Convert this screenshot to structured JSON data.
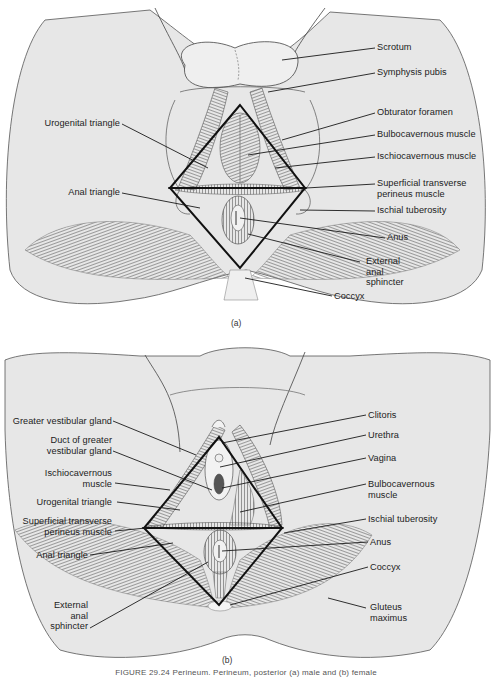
{
  "figure": {
    "caption": "FIGURE 29.24 Perineum. Perineum, posterior (a) male and (b) female",
    "panels": [
      {
        "id": "a",
        "tag": "(a)",
        "subject": "male perineum",
        "labels_left": [
          {
            "text": "Urogenital triangle"
          },
          {
            "text": "Anal triangle"
          }
        ],
        "labels_right": [
          {
            "text": "Scrotum"
          },
          {
            "text": "Symphysis pubis"
          },
          {
            "text": "Obturator foramen"
          },
          {
            "text": "Bulbocavernous muscle"
          },
          {
            "text": "Ischiocavernous muscle"
          },
          {
            "text": "Superficial transverse\nperineus muscle",
            "line1": "Superficial transverse",
            "line2": "perineus muscle"
          },
          {
            "text": "Ischial tuberosity"
          },
          {
            "text": "Anus"
          },
          {
            "text": "External anal sphincter",
            "line1": "External",
            "line2": "anal",
            "line3": "sphincter"
          },
          {
            "text": "Coccyx"
          }
        ]
      },
      {
        "id": "b",
        "tag": "(b)",
        "subject": "female perineum",
        "labels_left": [
          {
            "text": "Greater vestibular gland"
          },
          {
            "text": "Duct of greater vestibular gland",
            "line1": "Duct of greater",
            "line2": "vestibular gland"
          },
          {
            "text": "Ischiocavernous muscle",
            "line1": "Ischiocavernous",
            "line2": "muscle"
          },
          {
            "text": "Urogenital triangle"
          },
          {
            "text": "Superficial transverse perineus muscle",
            "line1": "Superficial transverse",
            "line2": "perineus muscle"
          },
          {
            "text": "Anal triangle"
          },
          {
            "text": "External anal sphincter",
            "line1": "External",
            "line2": "anal",
            "line3": "sphincter"
          }
        ],
        "labels_right": [
          {
            "text": "Clitoris"
          },
          {
            "text": "Urethra"
          },
          {
            "text": "Vagina"
          },
          {
            "text": "Bulbocavernous muscle",
            "line1": "Bulbocavernous",
            "line2": "muscle"
          },
          {
            "text": "Ischial tuberosity"
          },
          {
            "text": "Anus"
          },
          {
            "text": "Coccyx"
          },
          {
            "text": "Gluteus maximus",
            "line1": "Gluteus",
            "line2": "maximus"
          }
        ]
      }
    ]
  },
  "colors": {
    "skin_fill": "#e6e6e6",
    "outline": "#3a3a3a",
    "muscle": "#6a6a6a",
    "triangle": "#111111",
    "leader": "#1a1a1a"
  }
}
